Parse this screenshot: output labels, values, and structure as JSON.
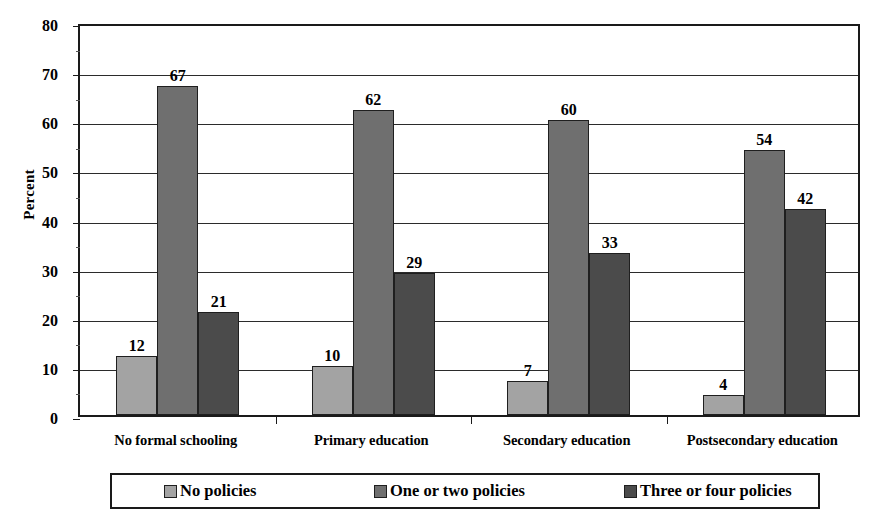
{
  "chart_data": {
    "type": "bar",
    "title": "",
    "xlabel": "",
    "ylabel": "Percent",
    "ylim": [
      0,
      80
    ],
    "ytick_step": 10,
    "yticks": [
      "0",
      "10",
      "20",
      "30",
      "40",
      "50",
      "60",
      "70",
      "80"
    ],
    "grid": true,
    "legend_position": "bottom",
    "categories": [
      "No formal schooling",
      "Primary education",
      "Secondary education",
      "Postsecondary education"
    ],
    "series": [
      {
        "name": "No policies",
        "color": "#a3a3a3",
        "values": [
          12,
          10,
          7,
          4
        ]
      },
      {
        "name": "One or two policies",
        "color": "#6f6f6f",
        "values": [
          67,
          62,
          60,
          54
        ]
      },
      {
        "name": "Three or four policies",
        "color": "#4b4b4b",
        "values": [
          21,
          29,
          33,
          42
        ]
      }
    ],
    "value_labels": [
      [
        "12",
        "67",
        "21"
      ],
      [
        "10",
        "62",
        "29"
      ],
      [
        "7",
        "60",
        "33"
      ],
      [
        "4",
        "54",
        "42"
      ]
    ]
  },
  "axis": {
    "y_title": "Percent"
  }
}
